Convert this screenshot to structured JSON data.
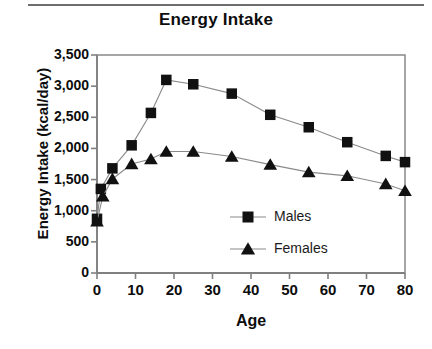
{
  "chart_data": {
    "type": "line",
    "title": "Energy Intake",
    "xlabel": "Age",
    "ylabel": "Energy Intake (kcal/day)",
    "xlim": [
      0,
      80
    ],
    "ylim": [
      0,
      3500
    ],
    "grid": false,
    "legend_position": "inside-lower-right",
    "xticks": [
      0,
      10,
      20,
      30,
      40,
      50,
      60,
      70,
      80
    ],
    "xtick_labels": [
      "0",
      "10",
      "20",
      "30",
      "40",
      "50",
      "60",
      "70",
      "80"
    ],
    "yticks": [
      0,
      500,
      1000,
      1500,
      2000,
      2500,
      3000,
      3500
    ],
    "ytick_labels": [
      "0",
      "500",
      "1,000",
      "1,500",
      "2,000",
      "2,500",
      "3,000",
      "3,500"
    ],
    "series": [
      {
        "name": "Males",
        "marker": "square",
        "color": "#111111",
        "x": [
          0,
          1,
          4,
          9,
          14,
          18,
          25,
          35,
          45,
          55,
          65,
          75,
          80
        ],
        "values": [
          870,
          1350,
          1680,
          2050,
          2570,
          3100,
          3030,
          2880,
          2540,
          2340,
          2100,
          1880,
          1780
        ]
      },
      {
        "name": "Females",
        "marker": "triangle",
        "color": "#111111",
        "x": [
          0,
          1.5,
          4,
          9,
          14,
          18,
          25,
          35,
          45,
          55,
          65,
          75,
          80
        ],
        "values": [
          830,
          1230,
          1510,
          1750,
          1830,
          1950,
          1950,
          1870,
          1740,
          1620,
          1560,
          1430,
          1320
        ]
      }
    ]
  },
  "legend": {
    "entries": [
      {
        "label": "Males",
        "marker": "square-marker-icon"
      },
      {
        "label": "Females",
        "marker": "triangle-marker-icon"
      }
    ]
  },
  "colors": {
    "series": "#111111",
    "axis": "#808080",
    "line": "#8a8a8a",
    "text": "#0d0d0d",
    "background": "#ffffff"
  }
}
